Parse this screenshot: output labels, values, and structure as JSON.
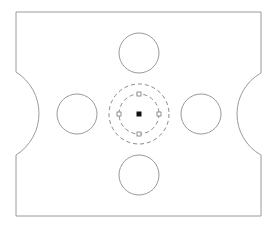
{
  "drawing": {
    "background": "#ffffff",
    "line_color": "#9a9a9a",
    "plate": {
      "left": 16,
      "top": 12,
      "right": 261,
      "bottom": 216,
      "left_notch": {
        "y_top": 72,
        "y_bottom": 155,
        "apex_x": 39
      },
      "right_notch": {
        "y_top": 73,
        "y_bottom": 155,
        "apex_x": 237
      }
    },
    "holes": [
      {
        "name": "hole-top",
        "cx": 139,
        "cy": 53,
        "r": 20
      },
      {
        "name": "hole-left",
        "cx": 77,
        "cy": 114,
        "r": 20
      },
      {
        "name": "hole-right",
        "cx": 201,
        "cy": 114,
        "r": 20
      },
      {
        "name": "hole-bottom",
        "cx": 139,
        "cy": 175,
        "r": 20
      }
    ],
    "selected_circle": {
      "cx": 139,
      "cy": 114,
      "inner_r": 20,
      "outer_r": 30,
      "dash_color": "#8a8a8a",
      "center_grip": {
        "size": 5,
        "color": "#111111"
      },
      "quadrant_grips": [
        {
          "x": 139,
          "y": 94
        },
        {
          "x": 159,
          "y": 114
        },
        {
          "x": 139,
          "y": 134
        },
        {
          "x": 119,
          "y": 114
        }
      ],
      "grip_size": 4
    }
  }
}
